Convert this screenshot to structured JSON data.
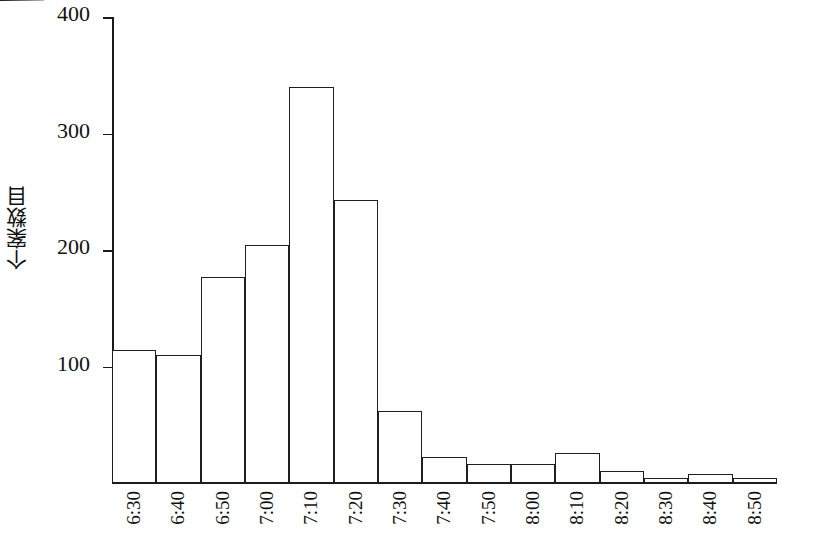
{
  "chart_data": {
    "type": "bar",
    "title": "",
    "subtitle": "",
    "xlabel": "",
    "ylabel": "个案数目",
    "categories": [
      "6:30",
      "6:40",
      "6:50",
      "7:00",
      "7:10",
      "7:20",
      "7:30",
      "7:40",
      "7:50",
      "8:00",
      "8:10",
      "8:20",
      "8:30",
      "8:40",
      "8:50"
    ],
    "values": [
      114,
      110,
      177,
      204,
      340,
      243,
      62,
      22,
      16,
      16,
      26,
      10,
      4,
      8,
      4
    ],
    "ylim": [
      0,
      400
    ],
    "yticks": [
      100,
      200,
      300,
      400
    ],
    "ytick_labels": [
      "100",
      "200",
      "300",
      "400"
    ],
    "xlim_labels_rotated": true,
    "grid": false,
    "legend": null,
    "bar_fill_color": "#ffffff",
    "bar_edge_color": "#1f1f1f",
    "background_color": "#ffffff",
    "axis_color": "#1a1a1a",
    "text_color": "#111111"
  },
  "axis": {
    "y_title": "个案数目",
    "ticks": [
      {
        "label": "400",
        "value": 400
      },
      {
        "label": "300",
        "value": 300
      },
      {
        "label": "200",
        "value": 200
      },
      {
        "label": "100",
        "value": 100
      }
    ]
  }
}
